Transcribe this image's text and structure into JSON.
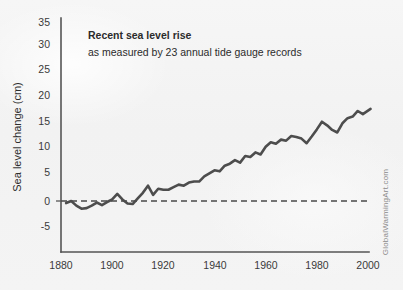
{
  "chart_data": {
    "type": "line",
    "title": "Recent sea level rise",
    "subtitle": "as measured by 23 annual tide gauge records",
    "xlabel": "",
    "ylabel": "Sea level change (cm)",
    "xlim": [
      1880,
      2000
    ],
    "ylim": [
      -7.5,
      35
    ],
    "xticks": [
      1880,
      1900,
      1920,
      1940,
      1960,
      1980,
      2000
    ],
    "xtick_labels": [
      "1880",
      "1900",
      "1920",
      "1940",
      "1960",
      "1980",
      "2000"
    ],
    "yticks": [
      -5,
      0,
      5,
      10,
      15,
      20,
      25,
      30,
      35
    ],
    "ytick_labels": [
      "-5",
      "0",
      "5",
      "10",
      "15",
      "20",
      "25",
      "30",
      "35"
    ],
    "grid": false,
    "legend": null,
    "reference_line": {
      "value": 0,
      "style": "dashed",
      "color": "#4a4a4a",
      "label": ""
    },
    "series": [
      {
        "name": "Sea level change",
        "color": "#4d4d4d",
        "units": "cm",
        "x": [
          1882,
          1884,
          1886,
          1888,
          1890,
          1892,
          1894,
          1896,
          1898,
          1900,
          1902,
          1904,
          1906,
          1908,
          1910,
          1912,
          1914,
          1916,
          1918,
          1920,
          1922,
          1924,
          1926,
          1928,
          1930,
          1932,
          1934,
          1936,
          1938,
          1940,
          1942,
          1944,
          1946,
          1948,
          1950,
          1952,
          1954,
          1956,
          1958,
          1960,
          1962,
          1964,
          1966,
          1968,
          1970,
          1972,
          1974,
          1976,
          1978,
          1980,
          1982,
          1984,
          1986,
          1988,
          1990,
          1992,
          1994,
          1996,
          1998,
          2001
        ],
        "y": [
          -0.4,
          0.0,
          -0.9,
          -1.5,
          -1.4,
          -0.9,
          -0.3,
          -0.8,
          -0.2,
          0.3,
          1.4,
          0.3,
          -0.5,
          -0.6,
          0.5,
          1.6,
          3.0,
          1.2,
          2.4,
          2.2,
          2.2,
          2.7,
          3.2,
          3.0,
          3.6,
          3.8,
          3.8,
          4.8,
          5.4,
          6.0,
          5.8,
          6.9,
          7.3,
          8.0,
          7.5,
          8.8,
          8.6,
          9.5,
          9.1,
          10.6,
          11.5,
          11.2,
          12.0,
          11.8,
          12.7,
          12.5,
          12.2,
          11.3,
          12.6,
          14.0,
          15.5,
          14.8,
          13.9,
          13.4,
          15.2,
          16.2,
          16.5,
          17.6,
          17.0,
          18.0
        ]
      }
    ]
  },
  "watermark": {
    "text": "GlobalWarmingArt.com"
  }
}
